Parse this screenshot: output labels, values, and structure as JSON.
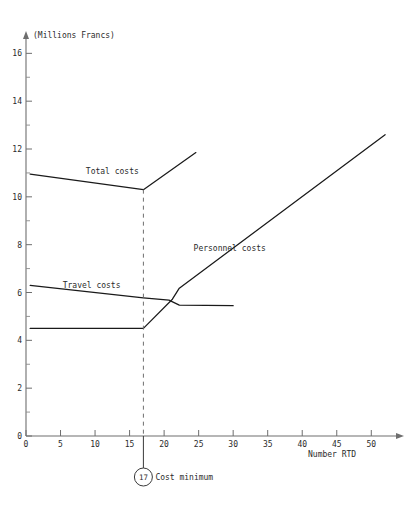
{
  "chart_data": {
    "type": "line",
    "title": "",
    "subtitle": "",
    "xlabel": "Number RTD",
    "ylabel": "(Millions Francs)",
    "xlim": [
      0,
      53
    ],
    "ylim": [
      0,
      16.6
    ],
    "grid": false,
    "legend_position": "inline-labels",
    "y_ticks_major": [
      0,
      2,
      4,
      6,
      8,
      10,
      12,
      14,
      16
    ],
    "y_tick_labels": [
      "0",
      "2",
      "4",
      "6",
      "8",
      "10",
      "12",
      "14",
      "16"
    ],
    "y_ticks_minor": [
      1,
      3,
      5,
      7,
      9,
      11,
      13,
      15
    ],
    "x_ticks_major": [
      0,
      5,
      10,
      15,
      20,
      25,
      30,
      35,
      40,
      45,
      50
    ],
    "x_tick_labels": [
      "0",
      "5",
      "10",
      "15",
      "20",
      "25",
      "30",
      "35",
      "40",
      "45",
      "50"
    ],
    "series": [
      {
        "name": "Total costs",
        "label": "Total costs",
        "label_x": 12.5,
        "label_y": 10.95,
        "x": [
          0.6,
          17.0,
          24.6
        ],
        "values": [
          10.95,
          10.3,
          11.85
        ]
      },
      {
        "name": "Travel costs",
        "label": "Travel costs",
        "label_x": 9.5,
        "label_y": 6.2,
        "x": [
          0.6,
          17.0,
          20.7,
          22.2,
          30.0
        ],
        "values": [
          6.3,
          5.78,
          5.68,
          5.47,
          5.45
        ]
      },
      {
        "name": "Personnel costs",
        "label": "Personnel costs",
        "label_x": 29.5,
        "label_y": 7.75,
        "x": [
          0.6,
          17.0,
          21.2,
          22.2,
          52.0
        ],
        "values": [
          4.5,
          4.5,
          5.72,
          6.18,
          12.6
        ]
      }
    ],
    "annotations": [
      {
        "name": "cost-minimum",
        "marker_value": "17",
        "text": "Cost minimum",
        "x": 17.0,
        "guide_from_y": 10.3,
        "guide_to_y": 0,
        "style": "dashed-vertical-with-circled-marker"
      }
    ],
    "colors": {
      "line": "#1a1a1a",
      "axis": "#6e6e6e",
      "text": "#2b2b2b",
      "background": "#ffffff"
    }
  }
}
